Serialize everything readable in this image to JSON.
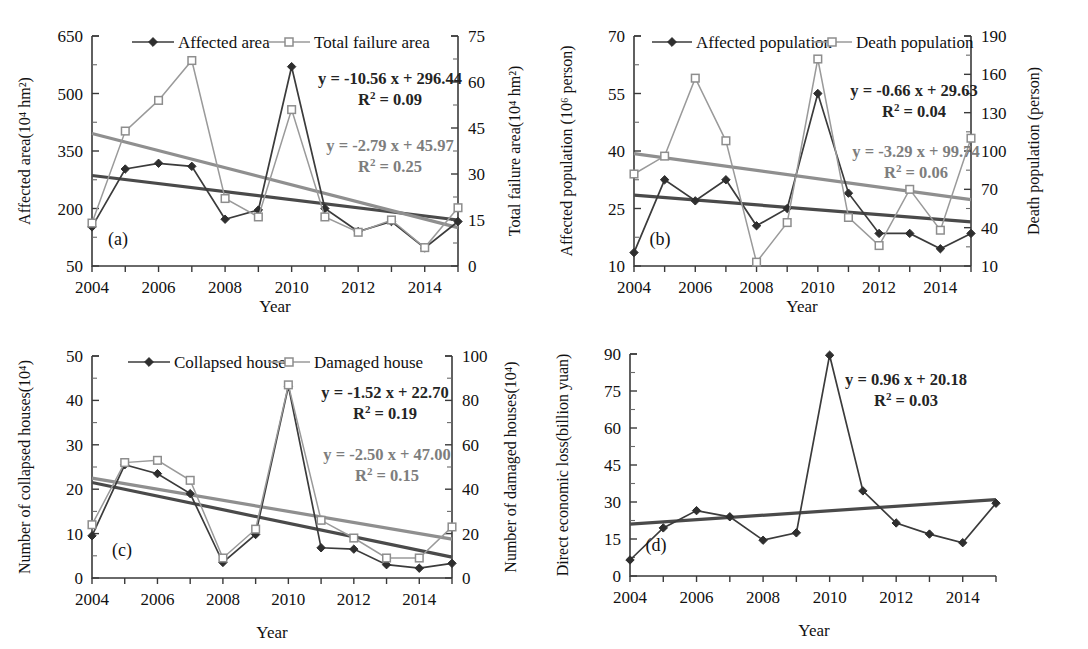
{
  "figure": {
    "xlabel": "Year",
    "x_tick_labels": [
      "2004",
      "2006",
      "2008",
      "2010",
      "2012",
      "2014"
    ],
    "x_years": [
      2004,
      2005,
      2006,
      2007,
      2008,
      2009,
      2010,
      2011,
      2012,
      2013,
      2014,
      2015
    ],
    "colors": {
      "dark_series": "#3b3b3b",
      "gray_series": "#9a9a9a",
      "dark_trend": "#4a4a4a",
      "gray_trend": "#8f8f8f",
      "equation_dark": "#242424",
      "equation_gray": "#7d7d7d",
      "axis": "#3a3a3a"
    }
  },
  "chart_data": [
    {
      "panel": "a",
      "panel_label": "(a)",
      "type": "line",
      "title": "",
      "xlabel": "Year",
      "ylabel": "Affected area(10⁴ hm²)",
      "y2label": "Total failure area(10⁴ hm²)",
      "x": [
        2004,
        2005,
        2006,
        2007,
        2008,
        2009,
        2010,
        2011,
        2012,
        2013,
        2014,
        2015
      ],
      "ylim": [
        50,
        650
      ],
      "yticks": [
        50,
        200,
        350,
        500,
        650
      ],
      "y2lim": [
        0,
        75
      ],
      "y2ticks": [
        0,
        15,
        30,
        45,
        60,
        75
      ],
      "grid": false,
      "legend_position": "top-center",
      "series": [
        {
          "name": "Affected area",
          "axis": "left",
          "marker": "diamond-filled",
          "color": "#3b3b3b",
          "values": [
            152,
            303,
            318,
            310,
            172,
            196,
            570,
            200,
            140,
            166,
            97,
            166
          ]
        },
        {
          "name": "Total failure area",
          "axis": "right",
          "marker": "square-open",
          "color": "#9a9a9a",
          "values": [
            14,
            44,
            54,
            67,
            22,
            16,
            51,
            16,
            11,
            15,
            6,
            19
          ]
        }
      ],
      "trendlines": [
        {
          "series": "Affected area",
          "axis": "left",
          "equation": "y = -10.56 x + 296.44",
          "r2": "R² = 0.09",
          "slope": -10.56,
          "intercept": 296.44,
          "color": "#4a4a4a",
          "start_value": 286,
          "end_value": 170
        },
        {
          "series": "Total failure area",
          "axis": "right",
          "equation": "y = -2.79 x + 45.97",
          "r2": "R² = 0.25",
          "slope": -2.79,
          "intercept": 45.97,
          "color": "#8f8f8f",
          "start_value": 43.2,
          "end_value": 12.5
        }
      ]
    },
    {
      "panel": "b",
      "panel_label": "(b)",
      "type": "line",
      "title": "",
      "xlabel": "Year",
      "ylabel": "Affected population (10⁶ person)",
      "y2label": "Death population (person)",
      "x": [
        2004,
        2005,
        2006,
        2007,
        2008,
        2009,
        2010,
        2011,
        2012,
        2013,
        2014,
        2015
      ],
      "ylim": [
        10,
        70
      ],
      "yticks": [
        10,
        25,
        40,
        55,
        70
      ],
      "y2lim": [
        10,
        190
      ],
      "y2ticks": [
        10,
        40,
        70,
        100,
        130,
        160,
        190
      ],
      "grid": false,
      "legend_position": "top-center",
      "series": [
        {
          "name": "Affected population",
          "axis": "left",
          "marker": "diamond-filled",
          "color": "#3b3b3b",
          "values": [
            13.5,
            32.5,
            27.0,
            32.5,
            20.5,
            25.0,
            55.0,
            29.0,
            18.5,
            18.5,
            14.5,
            18.5
          ]
        },
        {
          "name": "Death population",
          "axis": "right",
          "marker": "square-open",
          "color": "#9a9a9a",
          "values": [
            82,
            96,
            157,
            108,
            13,
            44,
            172,
            48,
            26,
            70,
            38,
            110
          ]
        }
      ],
      "trendlines": [
        {
          "series": "Affected population",
          "axis": "left",
          "equation": "y = -0.66 x + 29.63",
          "r2": "R² = 0.04",
          "slope": -0.66,
          "intercept": 29.63,
          "color": "#4a4a4a",
          "start_value": 28.5,
          "end_value": 21.5
        },
        {
          "series": "Death population",
          "axis": "right",
          "equation": "y = -3.29 x + 99.74",
          "r2": "R² = 0.06",
          "slope": -3.29,
          "intercept": 99.74,
          "color": "#8f8f8f",
          "start_value": 98,
          "end_value": 62
        }
      ]
    },
    {
      "panel": "c",
      "panel_label": "(c)",
      "type": "line",
      "title": "",
      "xlabel": "Year",
      "ylabel": "Number of collapsed houses(10⁴)",
      "y2label": "Number of damaged houses(10⁴)",
      "x": [
        2004,
        2005,
        2006,
        2007,
        2008,
        2009,
        2010,
        2011,
        2012,
        2013,
        2014,
        2015
      ],
      "ylim": [
        0,
        50
      ],
      "yticks": [
        0,
        10,
        20,
        30,
        40,
        50
      ],
      "y2lim": [
        0,
        100
      ],
      "y2ticks": [
        0,
        20,
        40,
        60,
        80,
        100
      ],
      "grid": false,
      "legend_position": "top-center",
      "series": [
        {
          "name": "Collapsed house",
          "axis": "left",
          "marker": "diamond-filled",
          "color": "#3b3b3b",
          "values": [
            9.5,
            25.5,
            23.5,
            19.0,
            3.5,
            9.8,
            43.2,
            6.8,
            6.5,
            3.0,
            2.2,
            3.3
          ]
        },
        {
          "name": "Damaged house",
          "axis": "right",
          "marker": "square-open",
          "color": "#9a9a9a",
          "values": [
            24,
            52,
            53,
            44,
            9,
            22,
            87,
            26,
            18,
            9,
            9,
            23
          ]
        }
      ],
      "trendlines": [
        {
          "series": "Collapsed house",
          "axis": "left",
          "equation": "y = -1.52 x + 22.70",
          "r2": "R² = 0.19",
          "slope": -1.52,
          "intercept": 22.7,
          "color": "#4a4a4a",
          "start_value": 21.5,
          "end_value": 4.7
        },
        {
          "series": "Damaged house",
          "axis": "right",
          "equation": "y = -2.50 x + 47.00",
          "r2": "R² = 0.15",
          "slope": -2.5,
          "intercept": 47.0,
          "color": "#8f8f8f",
          "start_value": 45,
          "end_value": 17.5
        }
      ]
    },
    {
      "panel": "d",
      "panel_label": "(d)",
      "type": "line",
      "title": "",
      "xlabel": "Year",
      "ylabel": "Direct economic loss(billion yuan)",
      "y2label": "",
      "x": [
        2004,
        2005,
        2006,
        2007,
        2008,
        2009,
        2010,
        2011,
        2012,
        2013,
        2014,
        2015
      ],
      "ylim": [
        0,
        90
      ],
      "yticks": [
        0,
        15,
        30,
        45,
        60,
        75,
        90
      ],
      "grid": false,
      "legend_position": "none",
      "series": [
        {
          "name": "Direct economic loss",
          "axis": "left",
          "marker": "diamond-filled",
          "color": "#3b3b3b",
          "values": [
            6.5,
            19.5,
            26.5,
            24.0,
            14.5,
            17.5,
            89.5,
            34.5,
            21.5,
            17.0,
            13.5,
            29.5
          ]
        }
      ],
      "trendlines": [
        {
          "series": "Direct economic loss",
          "axis": "left",
          "equation": "y = 0.96 x + 20.18",
          "r2": "R² = 0.03",
          "slope": 0.96,
          "intercept": 20.18,
          "color": "#4a4a4a",
          "start_value": 21,
          "end_value": 31
        }
      ]
    }
  ]
}
